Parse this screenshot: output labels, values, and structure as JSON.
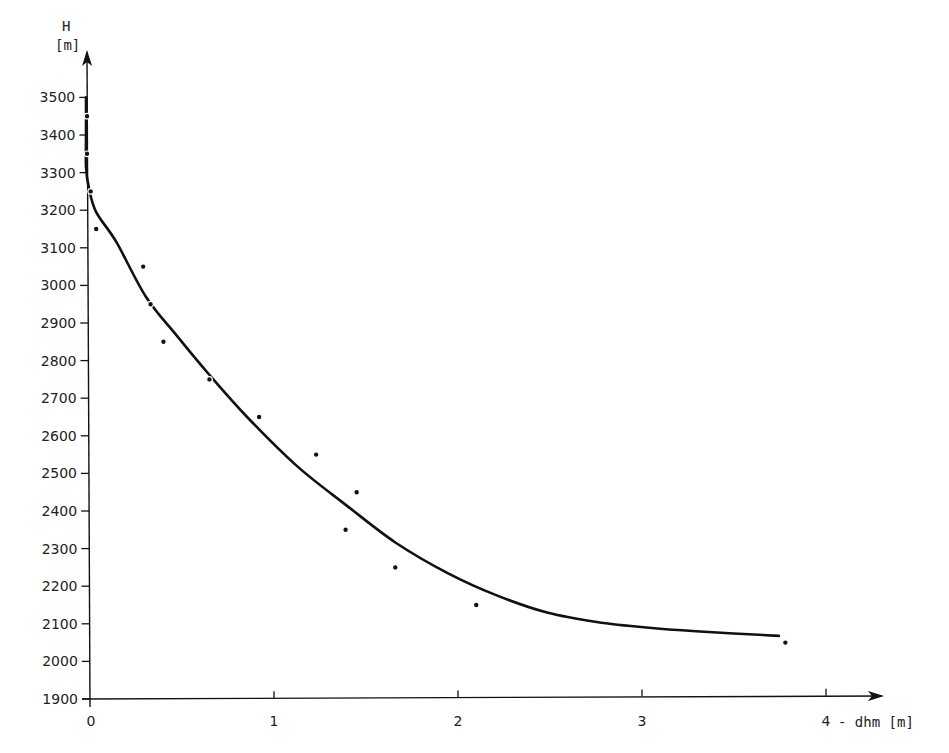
{
  "chart_data": {
    "type": "scatter",
    "title": "",
    "xlabel": "- dhm [m]",
    "ylabel": "H [m]",
    "ylabel_line1": "H",
    "ylabel_line2": "[m]",
    "xlim": [
      0,
      4.2
    ],
    "ylim": [
      1900,
      3600
    ],
    "grid": false,
    "legend": null,
    "x_ticks": [
      0,
      1,
      2,
      3,
      4
    ],
    "y_ticks": [
      1900,
      2000,
      2100,
      2200,
      2300,
      2400,
      2500,
      2600,
      2700,
      2800,
      2900,
      3000,
      3100,
      3200,
      3300,
      3400,
      3500
    ],
    "series": [
      {
        "name": "measured points",
        "kind": "scatter",
        "x": [
          0.0,
          0.0,
          0.02,
          0.05,
          0.3,
          0.34,
          0.41,
          0.66,
          0.93,
          1.24,
          1.46,
          1.4,
          1.67,
          2.11,
          3.79
        ],
        "y": [
          3450,
          3350,
          3250,
          3150,
          3050,
          2950,
          2850,
          2750,
          2650,
          2550,
          2450,
          2350,
          2250,
          2150,
          2050
        ]
      },
      {
        "name": "fitted curve",
        "kind": "line",
        "x": [
          0.0,
          0.0,
          0.0,
          0.01,
          0.05,
          0.16,
          0.32,
          0.49,
          0.66,
          0.87,
          1.14,
          1.41,
          1.68,
          1.96,
          2.23,
          2.5,
          2.77,
          3.04,
          3.31,
          3.76
        ],
        "y": [
          3500,
          3400,
          3315,
          3260,
          3195,
          3115,
          2970,
          2865,
          2765,
          2650,
          2520,
          2415,
          2315,
          2235,
          2175,
          2130,
          2105,
          2090,
          2080,
          2068
        ]
      }
    ]
  }
}
